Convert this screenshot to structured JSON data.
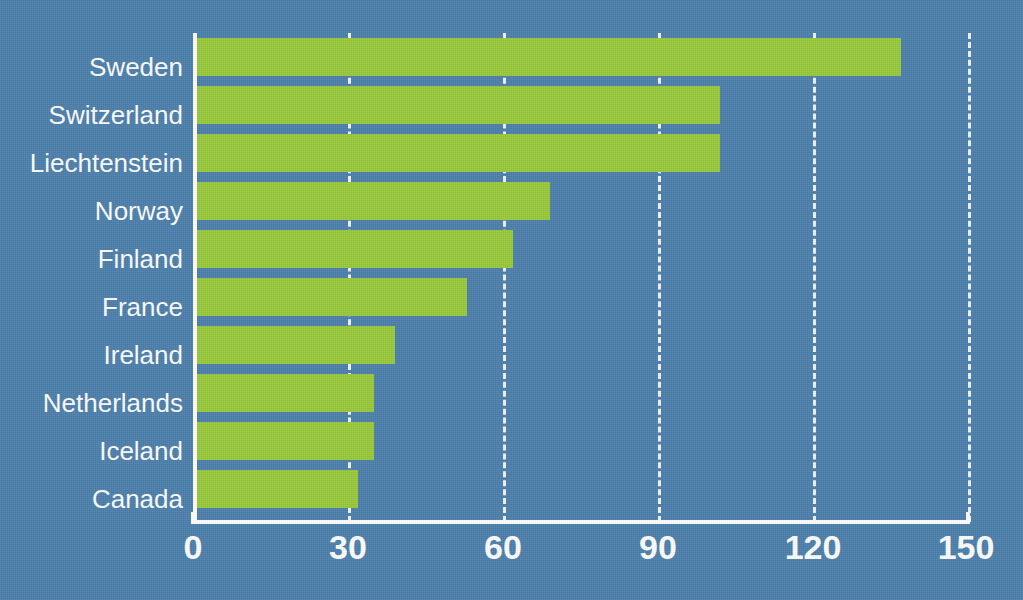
{
  "chart_data": {
    "type": "bar",
    "orientation": "horizontal",
    "title": "",
    "subtitle": "",
    "xlabel": "",
    "ylabel": "",
    "categories": [
      "Sweden",
      "Switzerland",
      "Liechtenstein",
      "Norway",
      "Finland",
      "France",
      "Ireland",
      "Netherlands",
      "Iceland",
      "Canada"
    ],
    "values": [
      137,
      102,
      102,
      69,
      62,
      53,
      39,
      35,
      35,
      32
    ],
    "xlim": [
      0,
      150
    ],
    "xticks": [
      0,
      30,
      60,
      90,
      120,
      150
    ],
    "xtick_labels": [
      "0",
      "30",
      "60",
      "90",
      "120",
      "150"
    ],
    "grid": true,
    "gridline_style": "dashed-white-vertical",
    "legend": null,
    "bar_color": "#9aca3c",
    "background_color": "#4d81ad",
    "text_color": "#ffffff",
    "axis_color": "#ffffff"
  },
  "axis": {
    "ticks": [
      {
        "label": "0",
        "value": 0
      },
      {
        "label": "30",
        "value": 30
      },
      {
        "label": "60",
        "value": 60
      },
      {
        "label": "90",
        "value": 90
      },
      {
        "label": "120",
        "value": 120
      },
      {
        "label": "150",
        "value": 150
      }
    ]
  },
  "bars": [
    {
      "label": "Sweden",
      "value": 137
    },
    {
      "label": "Switzerland",
      "value": 102
    },
    {
      "label": "Liechtenstein",
      "value": 102
    },
    {
      "label": "Norway",
      "value": 69
    },
    {
      "label": "Finland",
      "value": 62
    },
    {
      "label": "France",
      "value": 53
    },
    {
      "label": "Ireland",
      "value": 39
    },
    {
      "label": "Netherlands",
      "value": 35
    },
    {
      "label": "Iceland",
      "value": 35
    },
    {
      "label": "Canada",
      "value": 32
    }
  ]
}
